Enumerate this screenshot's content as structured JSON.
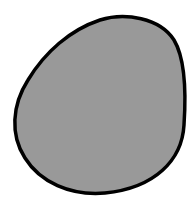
{
  "canvas": {
    "width": 195,
    "height": 203,
    "background": "#ffffff"
  },
  "shape": {
    "type": "blob",
    "fill": "#999999",
    "stroke": "#000000",
    "stroke_width": 3.5
  }
}
